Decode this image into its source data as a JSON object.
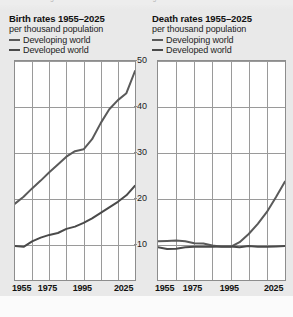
{
  "page": {
    "background_color": "#e9e9e9",
    "top_caption_cut_off": "rates are rising and the death rate is also rising in..."
  },
  "charts": [
    {
      "id": "birth-rates",
      "title": "Birth rates 1955–2025",
      "subtitle": "per thousand population",
      "legend": [
        {
          "label": "Developing world",
          "color": "#5a5a5a"
        },
        {
          "label": "Developed world",
          "color": "#4a4a4a"
        }
      ],
      "x_tick_labels": [
        "1955",
        "1975",
        "1995",
        "2025"
      ]
    },
    {
      "id": "death-rates",
      "title": "Death rates 1955–2025",
      "subtitle": "per thousand population",
      "legend": [
        {
          "label": "Developing world",
          "color": "#5a5a5a"
        },
        {
          "label": "Developed world",
          "color": "#4a4a4a"
        }
      ],
      "x_tick_labels": [
        "1955",
        "1975",
        "1995",
        "2025"
      ]
    }
  ],
  "shared_y_axis": {
    "ticks": [
      "50",
      "40",
      "30",
      "20",
      "10"
    ],
    "min": 0,
    "max": 50,
    "label_unit": "per thousand population"
  },
  "chart_data": [
    {
      "type": "line",
      "title": "Birth rates 1955–2025",
      "subtitle": "per thousand population",
      "xlabel": "",
      "ylabel": "per thousand population",
      "x": [
        1955,
        1960,
        1965,
        1970,
        1975,
        1980,
        1985,
        1990,
        1995,
        2000,
        2005,
        2010,
        2015,
        2020,
        2025
      ],
      "xlim": [
        1955,
        2025
      ],
      "ylim": [
        0,
        50
      ],
      "x_tick_labels": [
        "1955",
        "1975",
        "1995",
        "2025"
      ],
      "y_ticks": [
        10,
        20,
        30,
        40,
        50
      ],
      "grid": true,
      "legend_position": "above-plot",
      "series": [
        {
          "name": "Developing world",
          "color": "#5a5a5a",
          "values": [
            19.0,
            20.5,
            22.3,
            24.0,
            25.8,
            27.5,
            29.2,
            30.4,
            30.8,
            33.0,
            36.5,
            39.5,
            41.5,
            43.0,
            47.8
          ]
        },
        {
          "name": "Developed world",
          "color": "#4a4a4a",
          "values": [
            9.8,
            9.6,
            10.8,
            11.6,
            12.2,
            12.6,
            13.5,
            14.0,
            14.8,
            15.8,
            17.0,
            18.2,
            19.4,
            20.8,
            22.9
          ]
        }
      ]
    },
    {
      "type": "line",
      "title": "Death rates 1955–2025",
      "subtitle": "per thousand population",
      "xlabel": "",
      "ylabel": "per thousand population",
      "x": [
        1955,
        1960,
        1965,
        1970,
        1975,
        1980,
        1985,
        1990,
        1995,
        2000,
        2005,
        2010,
        2015,
        2020,
        2025
      ],
      "xlim": [
        1955,
        2025
      ],
      "ylim": [
        0,
        50
      ],
      "x_tick_labels": [
        "1955",
        "1975",
        "1995",
        "2025"
      ],
      "y_ticks": [
        10,
        20,
        30,
        40,
        50
      ],
      "grid": true,
      "legend_position": "above-plot",
      "series": [
        {
          "name": "Developing world",
          "color": "#5a5a5a",
          "values": [
            10.8,
            10.9,
            11.0,
            10.8,
            10.4,
            10.3,
            9.9,
            9.6,
            9.6,
            10.6,
            12.4,
            14.6,
            17.2,
            20.4,
            23.8
          ]
        },
        {
          "name": "Developed world",
          "color": "#4a4a4a",
          "values": [
            9.5,
            9.1,
            9.2,
            9.5,
            9.6,
            9.6,
            9.6,
            9.7,
            9.7,
            9.5,
            9.8,
            9.6,
            9.6,
            9.7,
            9.8
          ]
        }
      ]
    }
  ]
}
